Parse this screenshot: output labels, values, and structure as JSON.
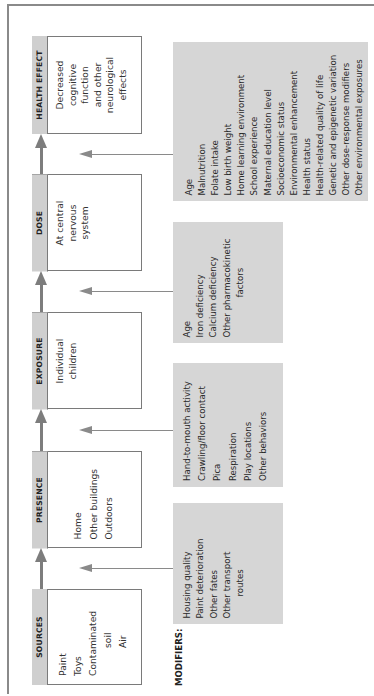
{
  "diagram": {
    "orientation": "rotated-90-ccw",
    "modifiers_label": "MODIFIERS:",
    "stages": [
      {
        "id": "sources",
        "title": "SOURCES",
        "items": [
          "Paint",
          "Toys",
          "Contaminated",
          "soil",
          "Air"
        ]
      },
      {
        "id": "presence",
        "title": "PRESENCE",
        "items": [
          "Home",
          "Other buildings",
          "Outdoors"
        ]
      },
      {
        "id": "exposure",
        "title": "EXPOSURE",
        "items": [
          "Individual",
          "children"
        ]
      },
      {
        "id": "dose",
        "title": "DOSE",
        "items": [
          "At central",
          "nervous",
          "system"
        ]
      },
      {
        "id": "health_effect",
        "title": "HEALTH EFFECT",
        "items": [
          "Decreased",
          "cognitive",
          "function",
          "and other",
          "neurological",
          "effects"
        ]
      }
    ],
    "modifiers": [
      {
        "target": "presence",
        "items": [
          "Housing quality",
          "Paint deterioration",
          "Other fates",
          "Other transport",
          "routes"
        ]
      },
      {
        "target": "exposure",
        "items": [
          "Hand-to-mouth activity",
          "Crawling/floor contact",
          "Pica",
          "Respiration",
          "Play locations",
          "Other behaviors"
        ]
      },
      {
        "target": "dose",
        "items": [
          "Age",
          "Iron deficiency",
          "Calcium deficiency",
          "Other pharmacokinetic",
          "factors"
        ]
      },
      {
        "target": "health_effect",
        "items": [
          "Age",
          "Malnutrition",
          "Folate intake",
          "Low birth weight",
          "Home learning environment",
          "School experience",
          "Maternal education level",
          "Socioeconomic status",
          "Environmental enhancement",
          "Health status",
          "Health-related quality of life",
          "Genetic and epigenetic variation",
          "Other dose-response modifiers",
          "Other environmental exposures"
        ]
      }
    ],
    "colors": {
      "header_fill": "#cfcfcf",
      "modifier_fill": "#d6d6d6",
      "arrow": "#7d7d7d",
      "border": "#7a7a7a"
    }
  }
}
